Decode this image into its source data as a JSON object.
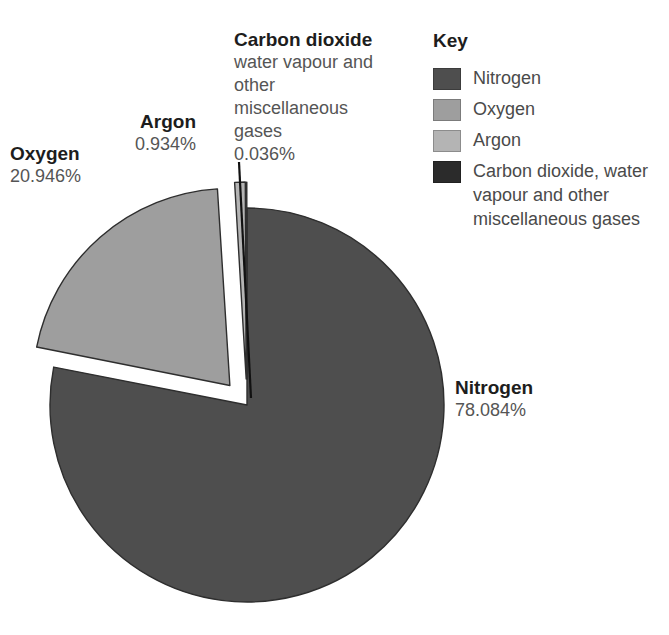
{
  "chart_data": {
    "type": "pie",
    "title": "",
    "subtitle": "",
    "xlabel": "",
    "ylabel": "",
    "units": "percent",
    "legend_position": "right",
    "grid": false,
    "start_angle_deg": 0,
    "direction": "clockwise",
    "categories": [
      "Nitrogen",
      "Oxygen",
      "Argon",
      "Carbon dioxide, water vapour and other miscellaneous gases"
    ],
    "values": [
      78.084,
      20.946,
      0.934,
      0.036
    ],
    "value_labels": [
      "78.084%",
      "20.946%",
      "0.934%",
      "0.036%"
    ],
    "colors": [
      "#4e4e4e",
      "#9e9e9e",
      "#b4b4b4",
      "#2b2b2b"
    ],
    "exploded": [
      false,
      true,
      true,
      true
    ],
    "slices": [
      {
        "name": "Nitrogen",
        "value": 78.084,
        "label": "78.084%",
        "color": "#4e4e4e",
        "exploded": false
      },
      {
        "name": "Oxygen",
        "value": 20.946,
        "label": "20.946%",
        "color": "#9e9e9e",
        "exploded": true
      },
      {
        "name": "Argon",
        "value": 0.934,
        "label": "0.934%",
        "color": "#b4b4b4",
        "exploded": true
      },
      {
        "name": "Carbon dioxide, water vapour and other miscellaneous gases",
        "value": 0.036,
        "label": "0.036%",
        "color": "#2b2b2b",
        "exploded": true
      }
    ]
  },
  "callouts": {
    "nitrogen": {
      "name": "Nitrogen",
      "value": "78.084%"
    },
    "oxygen": {
      "name": "Oxygen",
      "value": "20.946%"
    },
    "argon": {
      "name": "Argon",
      "value": "0.934%"
    },
    "carbon_dioxide": {
      "name": "Carbon dioxide",
      "detail": "water vapour and other miscellaneous gases",
      "value": "0.036%"
    }
  },
  "key": {
    "title": "Key",
    "items": [
      {
        "label": "Nitrogen",
        "color": "#4e4e4e",
        "swatch_icon": "legend-swatch-icon"
      },
      {
        "label": "Oxygen",
        "color": "#9e9e9e",
        "swatch_icon": "legend-swatch-icon"
      },
      {
        "label": "Argon",
        "color": "#b4b4b4",
        "swatch_icon": "legend-swatch-icon"
      },
      {
        "label": "Carbon dioxide, water vapour and other miscellaneous gases",
        "color": "#2b2b2b",
        "swatch_icon": "legend-swatch-icon"
      }
    ]
  },
  "style": {
    "background": "#ffffff",
    "slice_outline": "#2e2e2e",
    "text_primary": "#1d1d1d",
    "text_secondary": "#555555",
    "leader_line": "#111111"
  }
}
